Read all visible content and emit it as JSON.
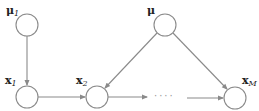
{
  "diagram": {
    "type": "graphical-model",
    "nodes": [
      {
        "id": "mu1",
        "label": "μ",
        "subscript": "1",
        "cx": 27,
        "cy": 25
      },
      {
        "id": "x1",
        "label": "x",
        "subscript": "1",
        "cx": 27,
        "cy": 97
      },
      {
        "id": "x2",
        "label": "x",
        "subscript": "2",
        "cx": 97,
        "cy": 97
      },
      {
        "id": "mu",
        "label": "μ",
        "subscript": "",
        "cx": 165,
        "cy": 25
      },
      {
        "id": "xM",
        "label": "x",
        "subscript": "M",
        "cx": 235,
        "cy": 98
      }
    ],
    "edges": [
      {
        "from": "mu1",
        "to": "x1"
      },
      {
        "from": "x1",
        "to": "x2"
      },
      {
        "from": "x2",
        "to": "ellipsis"
      },
      {
        "from": "ellipsis",
        "to": "xM"
      },
      {
        "from": "mu",
        "to": "x2"
      },
      {
        "from": "mu",
        "to": "xM"
      }
    ],
    "ellipsis": "····"
  }
}
